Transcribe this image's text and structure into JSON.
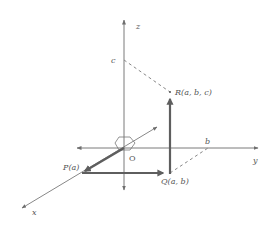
{
  "diagram": {
    "colors": {
      "axis": "#777777",
      "vector": "#666666",
      "dashed": "#888888",
      "label": "#555555",
      "background": "#ffffff"
    },
    "axes": {
      "x_label": "x",
      "y_label": "y",
      "z_label": "z",
      "origin_label": "O"
    },
    "points": {
      "P": "P(a)",
      "Q": "Q(a, b)",
      "R": "R(a, b, c)"
    },
    "tick_labels": {
      "b": "b",
      "c": "c"
    }
  }
}
